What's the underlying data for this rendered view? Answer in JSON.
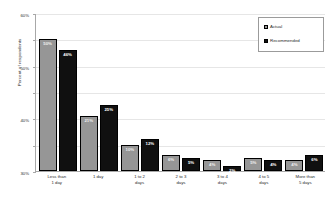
{
  "chart_data": {
    "type": "bar",
    "title": "",
    "xlabel": "",
    "ylabel": "Percent of respondents",
    "ylim": [
      0,
      60
    ],
    "grid": true,
    "legend_position": "top-right",
    "categories": [
      "Less than 1 day",
      "1 day",
      "1 to 2 days",
      "2 to 3 days",
      "3 to 4 days",
      "4 to 5 days",
      "More than 5 days"
    ],
    "category_lines": [
      [
        "Less than",
        "1 day"
      ],
      [
        "1 day",
        ""
      ],
      [
        "1 to 2",
        "days"
      ],
      [
        "2 to 3",
        "days"
      ],
      [
        "3 to 4",
        "days"
      ],
      [
        "4 to 5",
        "days"
      ],
      [
        "More than",
        "5 days"
      ]
    ],
    "series": [
      {
        "name": "Actual",
        "color": "#969696",
        "values": [
          50,
          21,
          10,
          6,
          4,
          5,
          4
        ],
        "labels": [
          "50%",
          "21%",
          "10%",
          "6%",
          "4%",
          "5%",
          "4%"
        ]
      },
      {
        "name": "Recommended",
        "color": "#101010",
        "values": [
          46,
          25,
          12,
          5,
          2,
          4,
          6
        ],
        "labels": [
          "46%",
          "25%",
          "12%",
          "5%",
          "2%",
          "4%",
          "6%"
        ]
      }
    ],
    "y_ticks": [
      0,
      10,
      20,
      30,
      40,
      50,
      60
    ],
    "y_tick_labels": [
      "0%",
      "10%",
      "20%",
      "30%",
      "40%",
      "50%",
      "60%"
    ]
  },
  "legend": {
    "items": [
      {
        "label": "Actual",
        "swatch": "actual"
      },
      {
        "label": "Recommended",
        "swatch": "recommended"
      }
    ]
  }
}
